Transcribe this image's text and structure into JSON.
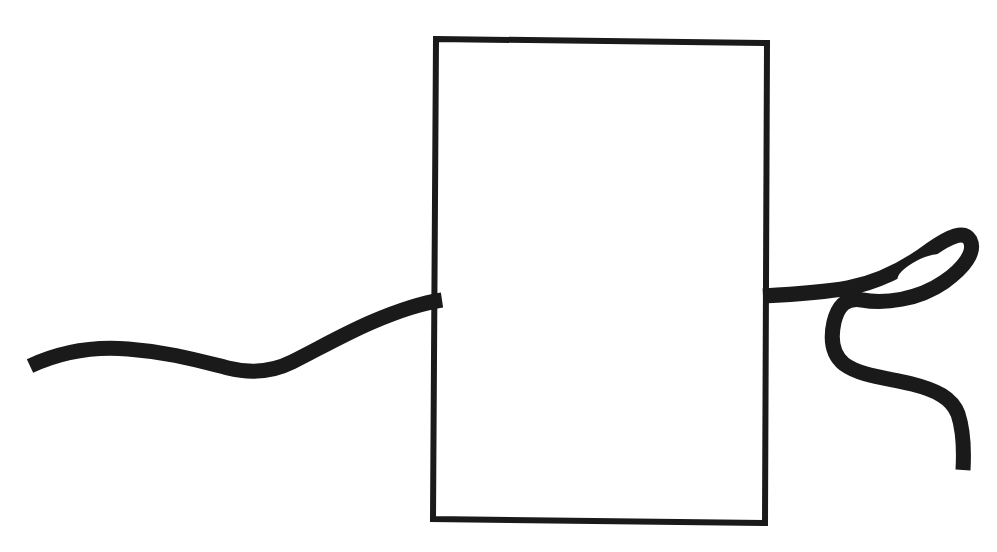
{
  "canvas": {
    "width": 997,
    "height": 552,
    "background_color": "#ffffff",
    "ink_color": "#1a1a1a",
    "title": "Hand-drawn rectangle with squiggly cord passing through"
  },
  "figure": {
    "style": "hand-drawn ink on white paper"
  },
  "shapes": {
    "rectangle": {
      "name": "rectangle-outline",
      "x": 436,
      "y": 39,
      "width": 331,
      "height": 484,
      "stroke_width": 6,
      "stroke_color": "#1a1a1a",
      "fill": "none",
      "corners": {
        "top_left": [
          436,
          39
        ],
        "top_right": [
          767,
          43
        ],
        "bottom_right": [
          765,
          523
        ],
        "bottom_left": [
          433,
          519
        ]
      }
    },
    "left_cord": {
      "name": "left-cord-squiggle",
      "stroke_width": 15,
      "stroke_color": "#1a1a1a",
      "start_point": [
        30,
        366
      ],
      "end_point": [
        442,
        300
      ],
      "path_d": "M 30,366 C 60,352 92,346 128,349 C 168,352 196,360 228,368 C 252,374 272,372 292,362 C 318,349 344,334 372,322 C 400,310 422,303 442,300",
      "waypoints": [
        [
          30,
          366
        ],
        [
          128,
          349
        ],
        [
          228,
          368
        ],
        [
          292,
          362
        ],
        [
          372,
          322
        ],
        [
          442,
          300
        ]
      ]
    },
    "right_cord": {
      "name": "right-cord-loop-and-tail",
      "stroke_width": 15,
      "stroke_color": "#1a1a1a",
      "start_point": [
        763,
        296
      ],
      "end_point": [
        963,
        470
      ],
      "loop_hole": {
        "name": "loop-hole",
        "center": [
          920,
          268
        ],
        "rx": 25,
        "ry": 8,
        "rotation_deg": -28
      },
      "path_d": "M 763,296 C 800,294 826,292 848,288 C 878,282 906,268 930,250 C 950,236 964,230 970,240 C 976,252 964,268 944,282 C 918,300 884,304 862,300 C 846,297 838,306 834,322 C 830,340 832,354 844,364 C 860,376 888,378 912,384 C 936,390 952,398 958,414 C 964,432 964,452 963,470",
      "waypoints": [
        [
          763,
          296
        ],
        [
          848,
          288
        ],
        [
          930,
          250
        ],
        [
          970,
          240
        ],
        [
          944,
          282
        ],
        [
          862,
          300
        ],
        [
          834,
          322
        ],
        [
          844,
          364
        ],
        [
          912,
          384
        ],
        [
          958,
          414
        ],
        [
          963,
          470
        ]
      ]
    }
  },
  "labels": {
    "visible_text": []
  }
}
